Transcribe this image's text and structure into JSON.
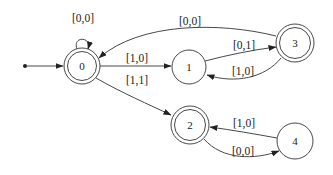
{
  "diagram": {
    "type": "state-machine",
    "nodes": [
      {
        "id": "0",
        "label": "0",
        "accepting": true,
        "initial": true
      },
      {
        "id": "1",
        "label": "1",
        "accepting": false
      },
      {
        "id": "2",
        "label": "2",
        "accepting": true
      },
      {
        "id": "3",
        "label": "3",
        "accepting": true
      },
      {
        "id": "4",
        "label": "4",
        "accepting": false
      }
    ],
    "edges": [
      {
        "from": "0",
        "to": "0",
        "label": "[0,0]"
      },
      {
        "from": "0",
        "to": "1",
        "label": "[1,0]"
      },
      {
        "from": "0",
        "to": "2",
        "label": "[1,1]"
      },
      {
        "from": "1",
        "to": "3",
        "label": "[0,1]"
      },
      {
        "from": "3",
        "to": "1",
        "label": "[1,0]"
      },
      {
        "from": "3",
        "to": "0",
        "label": "[0,0]"
      },
      {
        "from": "4",
        "to": "2",
        "label": "[1,0]"
      },
      {
        "from": "2",
        "to": "4",
        "label": "[0,0]"
      }
    ]
  }
}
